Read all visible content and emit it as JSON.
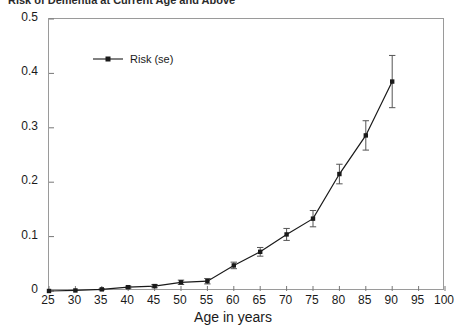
{
  "figure": {
    "title_clipped": "Risk of Dementia at Current Age and Above",
    "xlabel": "Age in years",
    "ylabel": ""
  },
  "legend": {
    "position": "top-left",
    "entries": [
      {
        "label": "Risk (se)",
        "marker": "square",
        "color": "#1a1a1a"
      }
    ]
  },
  "axes": {
    "x_ticks": [
      "25",
      "30",
      "35",
      "40",
      "45",
      "50",
      "55",
      "60",
      "65",
      "70",
      "75",
      "80",
      "85",
      "90",
      "95",
      "100"
    ],
    "y_ticks": [
      "0",
      "0.1",
      "0.2",
      "0.3",
      "0.4",
      "0.5"
    ]
  },
  "chart_data": {
    "type": "line",
    "title": "Risk of Dementia at Current Age and Above",
    "xlabel": "Age in years",
    "ylabel": "",
    "xlim": [
      25,
      100
    ],
    "ylim": [
      0,
      0.5
    ],
    "grid": false,
    "legend_position": "top-left",
    "x": [
      25,
      30,
      35,
      40,
      45,
      50,
      55,
      60,
      65,
      70,
      75,
      80,
      85,
      90
    ],
    "series": [
      {
        "name": "Risk (se)",
        "color": "#1a1a1a",
        "marker": "square",
        "values": [
          0.0,
          0.001,
          0.003,
          0.007,
          0.009,
          0.016,
          0.018,
          0.047,
          0.072,
          0.104,
          0.133,
          0.215,
          0.286,
          0.385
        ],
        "errors": [
          0.0,
          0.0,
          0.001,
          0.002,
          0.003,
          0.004,
          0.005,
          0.006,
          0.008,
          0.011,
          0.015,
          0.018,
          0.027,
          0.048
        ]
      }
    ]
  }
}
